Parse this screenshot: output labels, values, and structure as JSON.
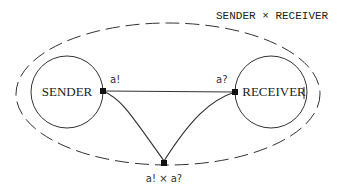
{
  "diagram": {
    "title": "SENDER × RECEIVER",
    "components": [
      {
        "id": "sender",
        "label": "SENDER",
        "port_label": "a!"
      },
      {
        "id": "receiver",
        "label": "RECEIVER",
        "port_label": "a?"
      }
    ],
    "composite_port_label": "a! × a?",
    "colors": {
      "stroke": "#333333",
      "background": "#ffffff"
    }
  }
}
